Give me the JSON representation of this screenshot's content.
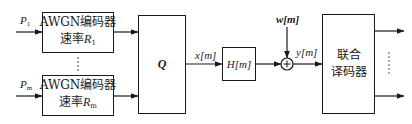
{
  "diagram": {
    "inputs": [
      {
        "power_label": "P",
        "power_sub": "1"
      },
      {
        "power_label": "P",
        "power_sub": "m"
      }
    ],
    "encoders": [
      {
        "line1": "AWGN编码器",
        "rate_prefix": "速率",
        "rate_symbol": "R",
        "rate_sub": "1"
      },
      {
        "line1": "AWGN编码器",
        "rate_prefix": "速率",
        "rate_symbol": "R",
        "rate_sub": "m"
      }
    ],
    "ellipsis": "⋮",
    "q_block": {
      "label": "Q"
    },
    "x_signal": {
      "label": "x[m]"
    },
    "channel": {
      "label": "H[m]"
    },
    "noise": {
      "label": "w[m]"
    },
    "adder": {
      "symbol": "+"
    },
    "y_signal": {
      "label": "y[m]"
    },
    "decoder": {
      "line1": "联合",
      "line2": "译码器"
    },
    "output_ellipsis": "⋮"
  }
}
